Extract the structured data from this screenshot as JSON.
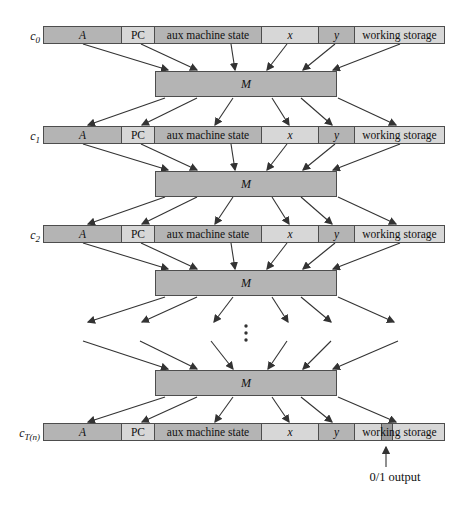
{
  "diagram": {
    "rows": [
      {
        "label_base": "c",
        "label_sub": "0"
      },
      {
        "label_base": "c",
        "label_sub": "1"
      },
      {
        "label_base": "c",
        "label_sub": "2"
      },
      {
        "label_base": "c",
        "label_sub": "T(n)"
      }
    ],
    "cell_labels": [
      "A",
      "PC",
      "aux machine state",
      "x",
      "y",
      "working storage"
    ],
    "machine_label": "M",
    "output_label": "0/1 output",
    "ellipsis_dots": 3,
    "colors": {
      "cell_dark": "#b4b4b4",
      "cell_light": "#d7d7d7",
      "machine_fill": "#b4b4b4",
      "output_bit": "#9b9b9b",
      "border_color": "#4d4d4d",
      "arrow_color": "#333333",
      "text_color": "#111111",
      "bg": "#ffffff"
    }
  }
}
